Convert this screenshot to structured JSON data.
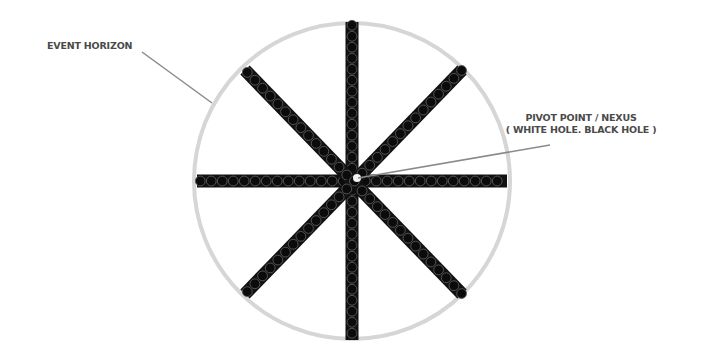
{
  "diagram": {
    "title": "",
    "labels": {
      "event_horizon": "EVENT HORIZON",
      "pivot_line1": "PIVOT POINT / NEXUS",
      "pivot_line2": "( WHITE HOLE. BLACK HOLE )"
    },
    "circle": {
      "cx": 352,
      "cy": 181,
      "r": 158,
      "stroke": "#d6d6d6",
      "stroke_width": 4
    },
    "spokes": [
      {
        "name": "horizontal",
        "x1": 197,
        "y1": 181,
        "x2": 507,
        "y2": 181
      },
      {
        "name": "vertical",
        "x1": 352,
        "y1": 22,
        "x2": 352,
        "y2": 340
      },
      {
        "name": "diagonal-down",
        "x1": 245,
        "y1": 70,
        "x2": 462,
        "y2": 294
      },
      {
        "name": "diagonal-up",
        "x1": 245,
        "y1": 294,
        "x2": 462,
        "y2": 70
      }
    ],
    "spoke_style": {
      "fill": "#111111",
      "bead_fill": "#0b0b0b",
      "bead_stroke": "#5a5a5a",
      "width": 13,
      "bead_spacing": 11
    },
    "leaders": [
      {
        "name": "event-horizon-leader",
        "x1": 142,
        "y1": 52,
        "x2": 212,
        "y2": 103,
        "color": "#8a8a8a"
      },
      {
        "name": "pivot-leader",
        "x1": 550,
        "y1": 145,
        "x2": 358,
        "y2": 178,
        "color": "#8a8a8a"
      }
    ],
    "nexus": {
      "cx": 357,
      "cy": 178,
      "r": 4,
      "fill": "#f2f2f2"
    }
  }
}
